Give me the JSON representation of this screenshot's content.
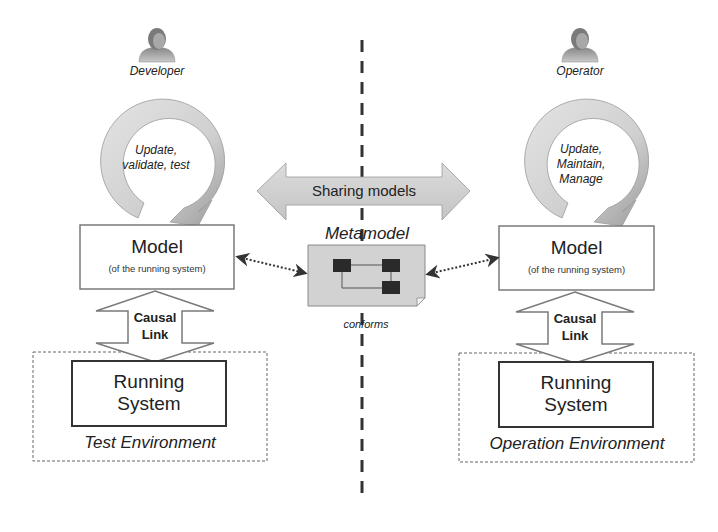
{
  "left": {
    "actor": "Developer",
    "cycle_lines": [
      "Update,",
      "validate, test"
    ],
    "model_title": "Model",
    "model_subtitle": "(of the running system)",
    "causal_lines": [
      "Causal",
      "Link"
    ],
    "running_lines": [
      "Running",
      "System"
    ],
    "environment": "Test Environment"
  },
  "right": {
    "actor": "Operator",
    "cycle_lines": [
      "Update,",
      "Maintain,",
      "Manage"
    ],
    "model_title": "Model",
    "model_subtitle": "(of the running system)",
    "causal_lines": [
      "Causal",
      "Link"
    ],
    "running_lines": [
      "Running",
      "System"
    ],
    "environment": "Operation Environment"
  },
  "center": {
    "sharing_label": "Sharing models",
    "metamodel_title": "Metamodel",
    "conforms_label": "conforms"
  },
  "colors": {
    "ring_light": "#d8d8d8",
    "ring_dark": "#9a9a9a",
    "box_border": "#7a7a7a",
    "running_border": "#333333",
    "metamodel_fill": "#d0d0d0",
    "metamodel_block": "#2a2a2a",
    "divider": "#333333"
  }
}
